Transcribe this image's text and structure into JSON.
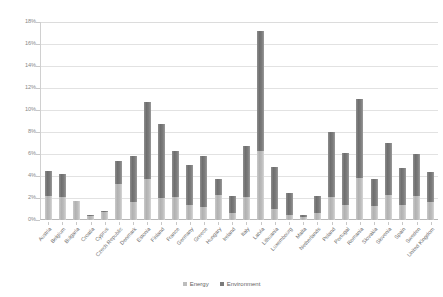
{
  "chart_data": {
    "type": "bar",
    "subtype": "stacked-vertical",
    "title": "",
    "xlabel": "",
    "ylabel": "",
    "ylim": [
      0,
      18
    ],
    "yunit": "%",
    "ytick_labels": [
      "18%",
      "16%",
      "14%",
      "12%",
      "10%",
      "8%",
      "6%",
      "4%",
      "2%",
      "0%"
    ],
    "ytick_values": [
      18,
      16,
      14,
      12,
      10,
      8,
      6,
      4,
      2,
      0
    ],
    "grid": true,
    "legend_position": "bottom",
    "categories": [
      "Austria",
      "Belgium",
      "Bulgaria",
      "Croatia",
      "Cyprus",
      "Czech Republic",
      "Denmark",
      "Estonia",
      "Finland",
      "France",
      "Germany",
      "Greece",
      "Hungary",
      "Ireland",
      "Italy",
      "Latvia",
      "Lithuania",
      "Luxembourg",
      "Malta",
      "Netherlands",
      "Poland",
      "Portugal",
      "Romania",
      "Slovakia",
      "Slovenia",
      "Spain",
      "Sweden",
      "United Kingdom"
    ],
    "series": [
      {
        "name": "Energy",
        "color": "#bdbdbd",
        "values": [
          2.2,
          2.1,
          1.7,
          0.4,
          0.7,
          3.3,
          1.6,
          3.7,
          2.0,
          2.1,
          1.4,
          1.2,
          2.3,
          0.6,
          2.1,
          6.3,
          1.0,
          0.5,
          0.3,
          0.6,
          2.1,
          1.4,
          3.8,
          1.3,
          2.3,
          1.4,
          2.2,
          1.6
        ]
      },
      {
        "name": "Environment",
        "color": "#7a7a7a",
        "values": [
          2.3,
          2.1,
          0.0,
          0.1,
          0.1,
          2.1,
          4.2,
          7.0,
          6.7,
          4.2,
          3.6,
          4.6,
          1.4,
          1.6,
          4.6,
          10.9,
          3.8,
          2.0,
          0.2,
          1.6,
          5.9,
          4.7,
          7.2,
          2.4,
          4.7,
          3.3,
          3.8,
          2.8
        ]
      }
    ],
    "totals": [
      4.5,
      4.2,
      1.7,
      0.5,
      0.8,
      5.4,
      5.8,
      10.7,
      8.7,
      6.3,
      5.0,
      5.8,
      3.7,
      2.2,
      6.7,
      17.2,
      4.8,
      2.5,
      0.5,
      2.2,
      8.0,
      6.1,
      11.0,
      3.7,
      7.0,
      4.7,
      6.0,
      4.4
    ]
  },
  "legend": {
    "items": [
      {
        "label": "Energy"
      },
      {
        "label": "Environment"
      }
    ]
  }
}
